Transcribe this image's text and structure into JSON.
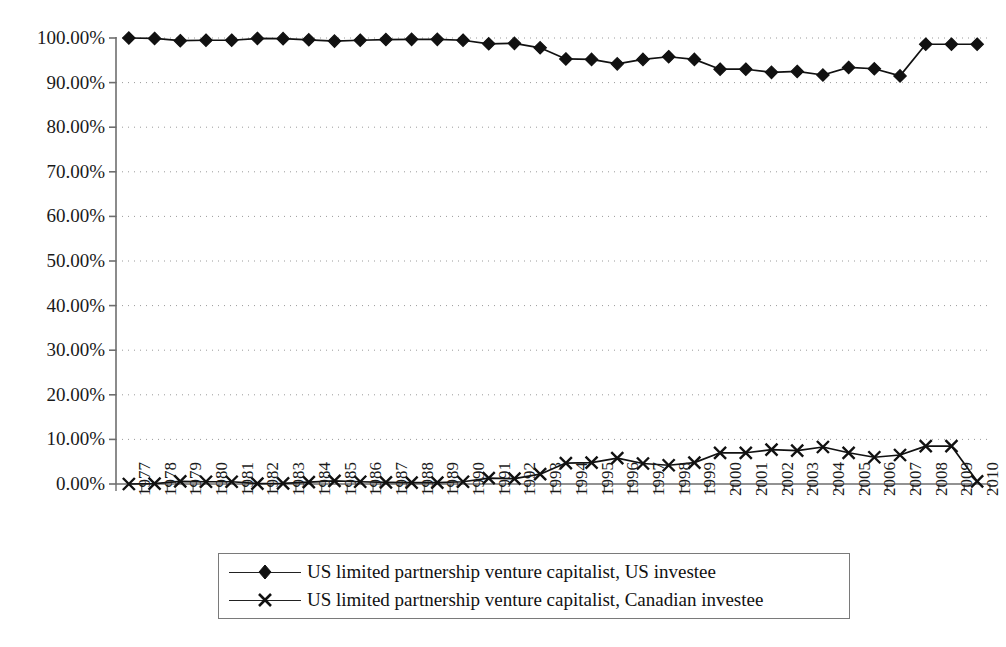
{
  "chart_data": {
    "type": "line",
    "title": "",
    "subtitle": "",
    "xlabel": "",
    "ylabel": "",
    "ylim": [
      0,
      100
    ],
    "ytick_format": "0.00%",
    "yticks": [
      0,
      10,
      20,
      30,
      40,
      50,
      60,
      70,
      80,
      90,
      100
    ],
    "ytick_labels": [
      "0.00%",
      "10.00%",
      "20.00%",
      "30.00%",
      "40.00%",
      "50.00%",
      "60.00%",
      "70.00%",
      "80.00%",
      "90.00%",
      "100.00%"
    ],
    "grid": "horizontal-dotted",
    "legend_position": "bottom",
    "categories": [
      "1977",
      "1978",
      "1979",
      "1980",
      "1981",
      "1982",
      "1983",
      "1984",
      "1985",
      "1986",
      "1987",
      "1988",
      "1989",
      "1990",
      "1991",
      "1992",
      "1993",
      "1994",
      "1995",
      "1996",
      "1997",
      "1998",
      "1999",
      "2000",
      "2001",
      "2002",
      "2003",
      "2004",
      "2005",
      "2006",
      "2007",
      "2008",
      "2009",
      "2010"
    ],
    "series": [
      {
        "name": "US limited partnership venture capitalist, US investee",
        "marker": "diamond",
        "color": "#111111",
        "values": [
          100.0,
          99.9,
          99.4,
          99.5,
          99.5,
          99.9,
          99.85,
          99.6,
          99.3,
          99.5,
          99.65,
          99.7,
          99.7,
          99.5,
          98.7,
          98.8,
          97.8,
          95.3,
          95.2,
          94.2,
          95.2,
          95.8,
          95.2,
          93.0,
          93.0,
          92.3,
          92.5,
          91.7,
          93.4,
          93.1,
          91.5,
          98.6,
          98.6,
          98.6
        ]
      },
      {
        "name": "US limited partnership venture capitalist, Canadian investee",
        "marker": "x",
        "color": "#111111",
        "values": [
          0.0,
          0.1,
          0.6,
          0.5,
          0.5,
          0.1,
          0.15,
          0.4,
          0.7,
          0.5,
          0.35,
          0.3,
          0.3,
          0.5,
          1.3,
          1.2,
          2.2,
          4.7,
          4.8,
          5.8,
          4.6,
          4.2,
          4.8,
          7.0,
          7.0,
          7.7,
          7.5,
          8.3,
          7.0,
          6.0,
          6.5,
          8.5,
          8.5,
          0.6
        ]
      }
    ]
  },
  "legend": {
    "entries": [
      {
        "label": "US limited partnership venture capitalist, US investee",
        "marker": "diamond"
      },
      {
        "label": "US limited partnership venture capitalist, Canadian investee",
        "marker": "x"
      }
    ]
  }
}
